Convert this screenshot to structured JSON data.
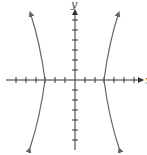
{
  "figure": {
    "type": "hyperbola-graph",
    "axes": {
      "x_label": "x",
      "y_label": "y",
      "x_ticks": [
        -6,
        -5,
        -4,
        -3,
        -2,
        -1,
        1,
        2,
        3,
        4,
        5,
        6
      ],
      "y_ticks": [
        -6,
        -5,
        -4,
        -3,
        -2,
        -1,
        1,
        2,
        3,
        4,
        5,
        6
      ],
      "tick_spacing_units": 1
    },
    "curve": {
      "branches": [
        "left",
        "right"
      ],
      "vertices": [
        [
          -3,
          0
        ],
        [
          3,
          0
        ]
      ],
      "color": "#666666"
    },
    "colors": {
      "axis": "#333333",
      "curve": "#666666",
      "background": "#ffffff"
    }
  }
}
